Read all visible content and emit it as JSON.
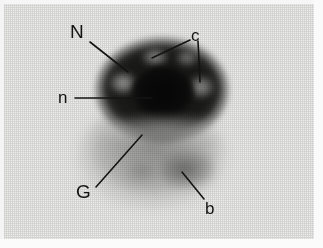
{
  "figure": {
    "kind": "light-micrograph",
    "width": 323,
    "height": 248,
    "background_color": "#ececeb",
    "annotation_color": "#141414"
  },
  "labels": [
    {
      "id": "N",
      "text": "N",
      "meaning": "nucleus",
      "label_x": 70,
      "label_y": 22,
      "leaders": [
        {
          "x1": 90,
          "y1": 42,
          "x2": 128,
          "y2": 72
        }
      ]
    },
    {
      "id": "c",
      "text": "c",
      "meaning": "chromocenter",
      "label_x": 191,
      "label_y": 27,
      "leaders": [
        {
          "x1": 190,
          "y1": 40,
          "x2": 152,
          "y2": 58
        },
        {
          "x1": 198,
          "y1": 41,
          "x2": 200,
          "y2": 82
        }
      ]
    },
    {
      "id": "n",
      "text": "n",
      "meaning": "nucleolus",
      "label_x": 58,
      "label_y": 89,
      "leaders": [
        {
          "x1": 75,
          "y1": 98,
          "x2": 152,
          "y2": 98
        }
      ]
    },
    {
      "id": "G",
      "text": "G",
      "meaning": "Golgi region",
      "label_x": 76,
      "label_y": 182,
      "leaders": [
        {
          "x1": 96,
          "y1": 187,
          "x2": 142,
          "y2": 135
        }
      ]
    },
    {
      "id": "b",
      "text": "b",
      "meaning": "basal body",
      "label_x": 205,
      "label_y": 200,
      "leaders": [
        {
          "x1": 204,
          "y1": 199,
          "x2": 182,
          "y2": 172
        }
      ]
    }
  ],
  "structures": [
    {
      "name": "nucleus",
      "tone": "very-dark",
      "shape": "ellipse"
    },
    {
      "name": "nucleolus",
      "tone": "black",
      "shape": "ellipse"
    },
    {
      "name": "chromocenters",
      "tone": "light",
      "count": 4
    },
    {
      "name": "cytoplasm",
      "tone": "mid-grey",
      "shape": "dome"
    },
    {
      "name": "basal-body",
      "tone": "dark-grey",
      "shape": "patch"
    }
  ]
}
